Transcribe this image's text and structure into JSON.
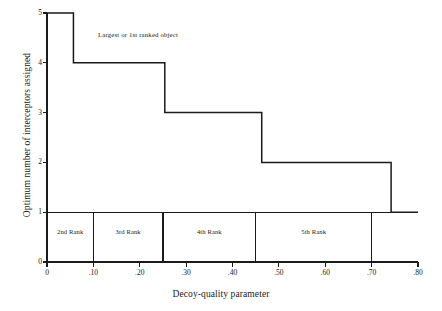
{
  "chart_data": {
    "type": "line",
    "title": "",
    "xlabel": "Decoy-quality parameter",
    "ylabel": "Optimum number of interceptors assigned",
    "xlim": [
      0,
      0.8
    ],
    "ylim": [
      0,
      5
    ],
    "grid": false,
    "legend": null,
    "xticks": [
      0,
      0.1,
      0.2,
      0.3,
      0.4,
      0.5,
      0.6,
      0.7,
      0.8
    ],
    "xticklabels": [
      "0",
      ".10",
      ".20",
      ".30",
      ".40",
      ".50",
      ".60",
      ".70",
      ".80"
    ],
    "yticks": [
      0,
      1,
      2,
      3,
      4,
      5
    ],
    "yticklabels": [
      "0",
      "1",
      "2",
      "3",
      "4",
      "5"
    ],
    "series": [
      {
        "name": "Largest or 1st ranked object",
        "step": "post",
        "points": [
          {
            "x": 0.0,
            "y": 5
          },
          {
            "x": 0.057,
            "y": 5
          },
          {
            "x": 0.057,
            "y": 4
          },
          {
            "x": 0.254,
            "y": 4
          },
          {
            "x": 0.254,
            "y": 3
          },
          {
            "x": 0.463,
            "y": 3
          },
          {
            "x": 0.463,
            "y": 2
          },
          {
            "x": 0.742,
            "y": 2
          },
          {
            "x": 0.742,
            "y": 1
          },
          {
            "x": 0.8,
            "y": 1
          }
        ]
      }
    ],
    "annotations": [
      {
        "text": "Largest or 1st ranked object",
        "x": 0.11,
        "y": 4.62
      }
    ],
    "rank_bands": [
      {
        "label": "2nd Rank",
        "x_start": 0.0,
        "x_end": 0.1,
        "y_start": 0,
        "y_end": 1
      },
      {
        "label": "3rd Rank",
        "x_start": 0.1,
        "x_end": 0.25,
        "y_start": 0,
        "y_end": 1
      },
      {
        "label": "4th Rank",
        "x_start": 0.25,
        "x_end": 0.45,
        "y_start": 0,
        "y_end": 1
      },
      {
        "label": "5th Rank",
        "x_start": 0.45,
        "x_end": 0.7,
        "y_start": 0,
        "y_end": 1
      }
    ],
    "colors": {
      "line": "#1a1a1a",
      "axis": "#1a1a1a",
      "background": "#ffffff"
    }
  }
}
